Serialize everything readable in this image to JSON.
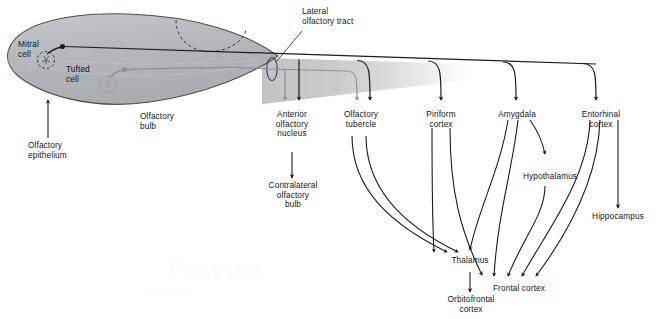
{
  "figure": {
    "watermark": "Pearson",
    "watermark_sub": "Education",
    "colors": {
      "mitral_path": "#1a1c20",
      "tufted_path": "#8d9196",
      "bulb_fill": "#b9bcc0",
      "bulb_stroke": "#4c4f54",
      "text": "#15171a",
      "background": "#ffffff"
    }
  },
  "labels": {
    "mitral_cell": "Mitral\ncell",
    "tufted_cell": "Tufted\ncell",
    "olfactory_bulb": "Olfactory\nbulb",
    "olfactory_epithelium": "Olfactory\nepithelium",
    "lateral_olfactory_tract": "Lateral\nolfactory tract",
    "anterior_olfactory_nucleus": "Anterior\nolfactory\nnucleus",
    "contralateral_olfactory_bulb": "Contralateral\nolfactory\nbulb",
    "olfactory_tubercle": "Olfactory\ntubercle",
    "piriform_cortex": "Piriform\ncortex",
    "amygdala": "Amygdala",
    "entorhinal_cortex": "Entorhinal\ncortex",
    "hypothalamus": "Hypothalamus",
    "hippocampus": "Hippocampus",
    "thalamus": "Thalamus",
    "orbitofrontal_cortex": "Orbitofrontal\ncortex",
    "frontal_cortex": "Frontal cortex"
  },
  "diagram_structure": {
    "source_region": "olfactory bulb",
    "projection_neurons": [
      "Mitral cell",
      "Tufted cell"
    ],
    "primary_targets": [
      "Anterior olfactory nucleus",
      "Olfactory tubercle",
      "Piriform cortex",
      "Amygdala",
      "Entorhinal cortex"
    ],
    "secondary_targets": [
      "Contralateral olfactory bulb",
      "Thalamus",
      "Hypothalamus",
      "Hippocampus",
      "Orbitofrontal cortex",
      "Frontal cortex"
    ],
    "connections": [
      {
        "from": "Olfactory epithelium",
        "to": "Olfactory bulb"
      },
      {
        "from": "Lateral olfactory tract",
        "to": "Anterior olfactory nucleus"
      },
      {
        "from": "Lateral olfactory tract",
        "to": "Olfactory tubercle"
      },
      {
        "from": "Lateral olfactory tract",
        "to": "Piriform cortex"
      },
      {
        "from": "Lateral olfactory tract",
        "to": "Amygdala"
      },
      {
        "from": "Lateral olfactory tract",
        "to": "Entorhinal cortex"
      },
      {
        "from": "Anterior olfactory nucleus",
        "to": "Contralateral olfactory bulb"
      },
      {
        "from": "Olfactory tubercle",
        "to": "Thalamus"
      },
      {
        "from": "Piriform cortex",
        "to": "Thalamus"
      },
      {
        "from": "Piriform cortex",
        "to": "Frontal cortex"
      },
      {
        "from": "Amygdala",
        "to": "Hypothalamus"
      },
      {
        "from": "Amygdala",
        "to": "Thalamus"
      },
      {
        "from": "Amygdala",
        "to": "Frontal cortex"
      },
      {
        "from": "Entorhinal cortex",
        "to": "Hippocampus"
      },
      {
        "from": "Entorhinal cortex",
        "to": "Frontal cortex"
      },
      {
        "from": "Thalamus",
        "to": "Orbitofrontal cortex"
      }
    ]
  }
}
